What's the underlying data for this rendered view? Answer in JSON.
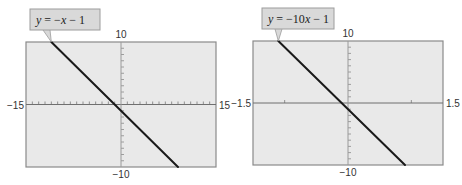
{
  "chart_data": [
    {
      "type": "line",
      "title": "",
      "equation_label": "y = −x − 1",
      "equation_parts": [
        "y",
        " = −",
        "x",
        " − 1"
      ],
      "function": "y = -x - 1",
      "slope": -1,
      "intercept": -1,
      "xlim": [
        -15,
        15
      ],
      "ylim": [
        -10,
        10
      ],
      "xscale": 1,
      "yscale": 1,
      "tick_labels": {
        "xmin": "−15",
        "xmax": "15",
        "ymin": "−10",
        "ymax": "10"
      },
      "x": [
        -11,
        9
      ],
      "y": [
        10,
        -10
      ],
      "grid": false,
      "frame": {
        "left": 26,
        "top": 42,
        "width": 190,
        "height": 125
      },
      "colors": {
        "background": "#e9e9e9",
        "line": "#1a1a1a",
        "label_box": "#d9d9d9",
        "frame": "#8a8a8a"
      }
    },
    {
      "type": "line",
      "title": "",
      "equation_label": "y = −10x − 1",
      "equation_parts": [
        "y",
        " = −10",
        "x",
        " − 1"
      ],
      "function": "y = -10x - 1",
      "slope": -10,
      "intercept": -1,
      "xlim": [
        -1.5,
        1.5
      ],
      "ylim": [
        -10,
        10
      ],
      "xscale": 1,
      "yscale": 1,
      "tick_labels": {
        "xmin": "−1.5",
        "xmax": "1.5",
        "ymin": "−10",
        "ymax": "10"
      },
      "x": [
        -1.1,
        0.9
      ],
      "y": [
        10,
        -10
      ],
      "grid": false,
      "frame": {
        "left": 253,
        "top": 41,
        "width": 190,
        "height": 124
      },
      "colors": {
        "background": "#e9e9e9",
        "line": "#1a1a1a",
        "label_box": "#d9d9d9",
        "frame": "#8a8a8a"
      }
    }
  ]
}
